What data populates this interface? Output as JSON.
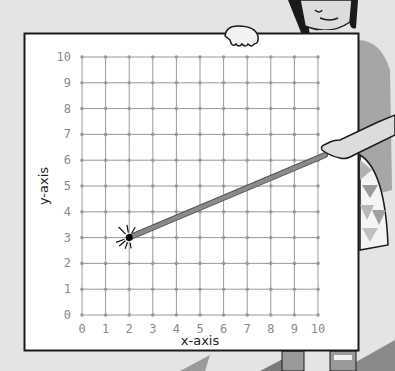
{
  "chart_data": {
    "type": "scatter",
    "title": "",
    "xlabel": "x-axis",
    "ylabel": "y-axis",
    "xlim": [
      0,
      10
    ],
    "ylim": [
      0,
      10
    ],
    "x_ticks": [
      "0",
      "1",
      "2",
      "3",
      "4",
      "5",
      "6",
      "7",
      "8",
      "9",
      "10"
    ],
    "y_ticks": [
      "0",
      "1",
      "2",
      "3",
      "4",
      "5",
      "6",
      "7",
      "8",
      "9",
      "10"
    ],
    "grid": true,
    "grid_points_marked": true,
    "legend": null,
    "points": [
      {
        "x": 2,
        "y": 3,
        "label": "highlighted point",
        "emphasis": "starburst"
      }
    ],
    "annotations": [
      {
        "type": "pointer",
        "description": "Pointer stick held by an illustrated person points at (2, 3)",
        "from": [
          10.3,
          6.2
        ],
        "to": [
          2,
          3
        ]
      }
    ]
  },
  "labels": {
    "x_axis": "x-axis",
    "y_axis": "y-axis"
  },
  "colors": {
    "background": "#e4e4e4",
    "board": "#ffffff",
    "board_border": "#1a1a1a",
    "grid": "#9a9a9a",
    "tick_text": "#8a8a8a",
    "pointer": "#8a8a8a",
    "point": "#000000",
    "shirt": "#a6a6a6",
    "skin": "#dcdcdc"
  },
  "illustration": {
    "figure": "cartoon person holding a coordinate grid board and a pointer"
  }
}
